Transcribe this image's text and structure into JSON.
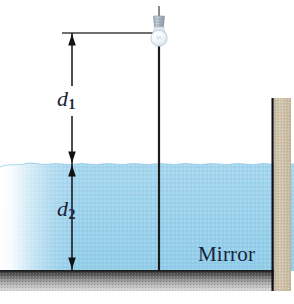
{
  "figure": {
    "background_color": "#ffffff",
    "width": 294,
    "height": 304
  },
  "labels": {
    "d1": "d",
    "d1_sub": "1",
    "d2": "d",
    "d2_sub": "2",
    "mirror": "Mirror"
  },
  "elements": {
    "light_bulb": {
      "name": "light-bulb",
      "glass_color": "#e9f2f8",
      "base_color": "#aab6c2",
      "x": 159,
      "y": 30
    },
    "support_rod": {
      "name": "vertical-rod",
      "color": "#1a1a1a",
      "x": 159,
      "y_top": 45,
      "y_bottom": 271
    },
    "reference_line": {
      "name": "top-reference-line",
      "color": "#3a3a3a",
      "y": 33,
      "x_start": 62,
      "x_end": 156
    },
    "dimension_arrow": {
      "name": "dimension-arrows",
      "color": "#1a1a1a",
      "x": 72,
      "y_top": 33,
      "y_mid": 164,
      "y_bottom": 270
    },
    "water": {
      "name": "water-body",
      "color": "#9ed2ec",
      "color_deep": "#8ac8e6",
      "surface_y": 164,
      "bottom_y": 270
    },
    "mirror_surface": {
      "name": "mirror-surface",
      "color_top": "#3b3b3b",
      "color_bottom": "#cfcfcf",
      "y_top": 270,
      "y_bottom": 291
    },
    "right_wall": {
      "name": "right-wall",
      "color": "#cfc2ab",
      "edge_color": "#111111",
      "x_left": 273,
      "x_right": 291,
      "y_top": 98,
      "y_bottom": 291
    }
  },
  "colors": {
    "water": "#9ed2ec",
    "wall": "#cfc2ab",
    "mirror_dark": "#3b3b3b",
    "ink": "#1a1a1a",
    "text": "#16253c"
  }
}
